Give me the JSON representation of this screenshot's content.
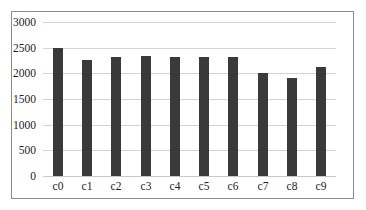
{
  "chart_data": {
    "type": "bar",
    "title": "",
    "xlabel": "",
    "ylabel": "",
    "categories": [
      "c0",
      "c1",
      "c2",
      "c3",
      "c4",
      "c5",
      "c6",
      "c7",
      "c8",
      "c9"
    ],
    "values": [
      2490,
      2260,
      2310,
      2340,
      2320,
      2310,
      2320,
      2000,
      1900,
      2120
    ],
    "ylim": [
      0,
      3000
    ],
    "yticks": [
      "0",
      "500",
      "1000",
      "1500",
      "2000",
      "2500",
      "3000"
    ],
    "grid": true,
    "legend": null,
    "bar_color": "#3a3a3a"
  }
}
